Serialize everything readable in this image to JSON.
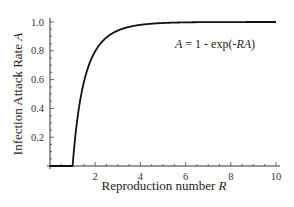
{
  "chart_data": {
    "type": "line",
    "title": "",
    "xlabel": "Reproduction number R",
    "xlabel_parts": {
      "text": "Reproduction number ",
      "var": "R"
    },
    "ylabel": "Infection Attack Rate A",
    "ylabel_parts": {
      "text": "Infection Attack Rate ",
      "var": "A"
    },
    "annotation": "A = 1 - exp(-RA)",
    "annotation_parts": {
      "lhs": "A",
      "eq": " = 1 - exp(-",
      "var": "RA",
      "close": ")"
    },
    "xlim": [
      0,
      10
    ],
    "ylim": [
      0,
      1.0
    ],
    "x_ticks": [
      2,
      4,
      6,
      8,
      10
    ],
    "x_tick_labels": [
      "2",
      "4",
      "6",
      "8",
      "10"
    ],
    "y_ticks": [
      0.2,
      0.4,
      0.6,
      0.8,
      1.0
    ],
    "y_tick_labels": [
      "0.2",
      "0.4",
      "0.6",
      "0.8",
      "1.0"
    ],
    "grid": false,
    "legend": "none",
    "series": [
      {
        "name": "A = 1 - exp(-RA)",
        "x": [
          0,
          0.5,
          1.0,
          1.1,
          1.2,
          1.3,
          1.5,
          1.75,
          2,
          2.5,
          3,
          3.5,
          4,
          5,
          6,
          7,
          8,
          9,
          10
        ],
        "y": [
          0,
          0,
          0,
          0.176,
          0.314,
          0.424,
          0.583,
          0.712,
          0.797,
          0.893,
          0.94,
          0.965,
          0.98,
          0.993,
          0.9975,
          0.9991,
          0.9997,
          0.9999,
          1.0
        ]
      }
    ]
  }
}
